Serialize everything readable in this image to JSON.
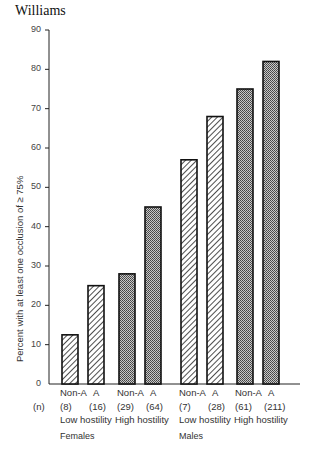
{
  "header": {
    "author": "Williams"
  },
  "chart_data": {
    "type": "bar",
    "title": "",
    "xlabel": "",
    "ylabel": "Percent with at least one occlusion of ≥ 75%",
    "ylim": [
      0,
      90
    ],
    "yticks": [
      0,
      10,
      20,
      30,
      40,
      50,
      60,
      70,
      80,
      90
    ],
    "grid": false,
    "n_row_label": "(n)",
    "categories": [
      "Non-A",
      "A",
      "Non-A",
      "A",
      "Non-A",
      "A",
      "Non-A",
      "A"
    ],
    "n": [
      "(8)",
      "(16)",
      "(29)",
      "(64)",
      "(7)",
      "(28)",
      "(61)",
      "(211)"
    ],
    "hostility": [
      "Low hostility",
      "Low hostility",
      "High hostility",
      "High hostility",
      "Low hostility",
      "Low hostility",
      "High hostility",
      "High hostility"
    ],
    "sex": [
      "Females",
      "Females",
      "Females",
      "Females",
      "Males",
      "Males",
      "Males",
      "Males"
    ],
    "values": [
      12.5,
      25,
      28,
      45,
      57,
      68,
      75,
      82
    ],
    "fill": [
      "hatched",
      "hatched",
      "stippled",
      "stippled",
      "hatched",
      "hatched",
      "stippled",
      "stippled"
    ],
    "group_labels": {
      "hostility": [
        {
          "label": "Low hostility",
          "x": 62
        },
        {
          "label": "High hostility",
          "x": 117
        },
        {
          "label": "Low hostility",
          "x": 181
        },
        {
          "label": "High hostility",
          "x": 236
        }
      ],
      "sex": [
        {
          "label": "Females",
          "x": 62
        },
        {
          "label": "Males",
          "x": 181
        }
      ]
    }
  }
}
